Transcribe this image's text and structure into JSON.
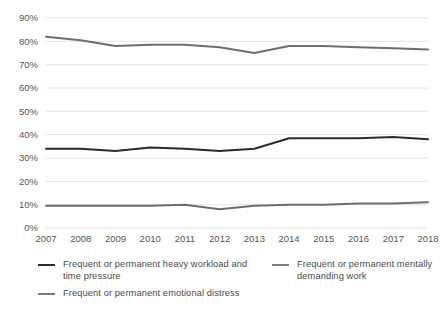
{
  "chart_data": {
    "type": "line",
    "title": "",
    "subtitle": "",
    "xlabel": "",
    "ylabel": "",
    "categories": [
      "2007",
      "2008",
      "2009",
      "2010",
      "2011",
      "2012",
      "2013",
      "2014",
      "2015",
      "2016",
      "2017",
      "2018"
    ],
    "ylim": [
      0,
      90
    ],
    "ytick_labels": [
      "0%",
      "10%",
      "20%",
      "30%",
      "40%",
      "50%",
      "60%",
      "70%",
      "80%",
      "90%"
    ],
    "ytick_values": [
      0,
      10,
      20,
      30,
      40,
      50,
      60,
      70,
      80,
      90
    ],
    "grid": true,
    "grid_axis": "y",
    "legend_position": "bottom",
    "series": [
      {
        "name": "Frequent or permanent mentally demanding work",
        "color": "#6e6e6e",
        "values": [
          82,
          80.5,
          78,
          78.5,
          78.5,
          77.5,
          75,
          78,
          78,
          77.5,
          77,
          76.5
        ]
      },
      {
        "name": "Frequent or permanent heavy workload and time pressure",
        "color": "#2b2b2b",
        "values": [
          34,
          34,
          33,
          34.5,
          34,
          33,
          34,
          38.5,
          38.5,
          38.5,
          39,
          38
        ]
      },
      {
        "name": "Frequent or permanent emotional distress",
        "color": "#6e6e6e",
        "values": [
          9.5,
          9.5,
          9.5,
          9.5,
          10,
          8,
          9.5,
          10,
          10,
          10.5,
          10.5,
          11
        ]
      }
    ]
  },
  "legend": {
    "left_entries": [
      {
        "label": "Frequent or permanent heavy workload and time pressure",
        "color": "#2b2b2b"
      },
      {
        "label": "Frequent or permanent emotional distress",
        "color": "#7a7a7a"
      }
    ],
    "right_entries": [
      {
        "label": "Frequent or permanent mentally demanding work",
        "color": "#7a7a7a"
      }
    ]
  },
  "style": {
    "grid_color": "#e4e4e4",
    "axis_text_color": "#555555",
    "background": "#ffffff"
  }
}
